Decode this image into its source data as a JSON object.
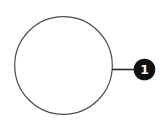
{
  "diagram": {
    "callout": {
      "number": "1"
    },
    "colors": {
      "background": "#ffffff",
      "circle_outline": "#4d4d4d",
      "leader_line": "#2b2b2b",
      "badge_fill": "#111111",
      "badge_text": "#ffffff"
    }
  }
}
